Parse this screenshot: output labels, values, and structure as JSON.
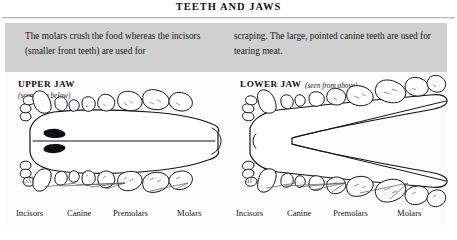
{
  "page": {
    "title": "TEETH AND JAWS",
    "background_color": "#ffffff",
    "panel_color": "#d3d3d3",
    "plate_color": "#fdfdfd",
    "ink_color": "#14141a"
  },
  "intro": {
    "left_column": "The molars crush the food whereas the incisors (smaller front teeth) are used for",
    "right_column": "scraping. The large, pointed canine teeth are used for tearing meat."
  },
  "diagrams": [
    {
      "id": "upper-jaw",
      "heading": "UPPER JAW",
      "subheading": "(seen from below)",
      "captions": [
        {
          "label": "Incisors"
        },
        {
          "label": "Canine"
        },
        {
          "label": "Premolars"
        },
        {
          "label": "Molars"
        }
      ]
    },
    {
      "id": "lower-jaw",
      "heading": "LOWER JAW",
      "subheading": "(seen from above)",
      "captions": [
        {
          "label": "Incisors"
        },
        {
          "label": "Canine"
        },
        {
          "label": "Premolars"
        },
        {
          "label": "Molars"
        }
      ]
    }
  ]
}
